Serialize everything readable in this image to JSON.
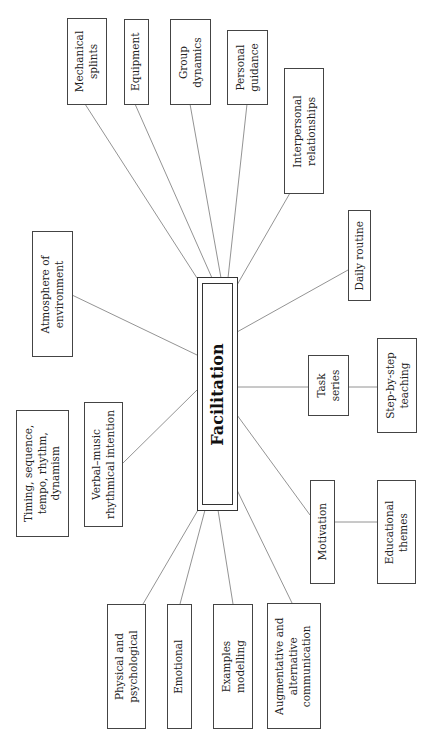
{
  "diagram": {
    "center": {
      "label": "Facilitation"
    },
    "nodes": {
      "mechanical_splints": "Mechanical\nsplints",
      "equipment": "Equipment",
      "group_dynamics": "Group\ndynamics",
      "personal_guidance": "Personal\nguidance",
      "interpersonal_relationships": "Interpersonal\nrelationships",
      "atmosphere_of_environment": "Atmosphere of\nenvironment",
      "daily_routine": "Daily routine",
      "task_series": "Task\nseries",
      "step_by_step_teaching": "Step-by-step\nteaching",
      "timing": "Timing, sequence,\ntempo, rhythm,\ndynamism",
      "verbal_music": "Verbal–music\nrhythmical intention",
      "motivation": "Motivation",
      "educational_themes": "Educational\nthemes",
      "physical_psychological": "Physical and\npsychological",
      "emotional": "Emotional",
      "examples_modelling": "Examples\nmodelling",
      "augmentative_communication": "Augmentative and\nalternative\ncommunication"
    },
    "edges": [
      [
        "Facilitation",
        "Mechanical splints"
      ],
      [
        "Facilitation",
        "Equipment"
      ],
      [
        "Facilitation",
        "Group dynamics"
      ],
      [
        "Facilitation",
        "Personal guidance"
      ],
      [
        "Facilitation",
        "Interpersonal relationships"
      ],
      [
        "Facilitation",
        "Atmosphere of environment"
      ],
      [
        "Facilitation",
        "Daily routine"
      ],
      [
        "Facilitation",
        "Task series"
      ],
      [
        "Task series",
        "Step-by-step teaching"
      ],
      [
        "Facilitation",
        "Verbal–music rhythmical intention"
      ],
      [
        "Facilitation",
        "Motivation"
      ],
      [
        "Motivation",
        "Educational themes"
      ],
      [
        "Facilitation",
        "Physical and psychological"
      ],
      [
        "Facilitation",
        "Emotional"
      ],
      [
        "Facilitation",
        "Examples modelling"
      ],
      [
        "Facilitation",
        "Augmentative and alternative communication"
      ]
    ]
  }
}
